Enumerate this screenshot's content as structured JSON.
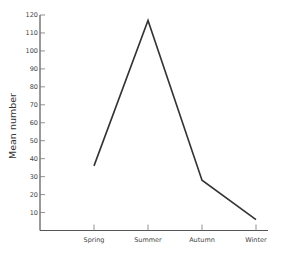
{
  "chart_data": {
    "type": "line",
    "title": "",
    "xlabel": "",
    "ylabel": "Mean number",
    "categories": [
      "Spring",
      "Summer",
      "Autumn",
      "Winter"
    ],
    "values": [
      36,
      117,
      28,
      6
    ],
    "ylim": [
      0,
      120
    ],
    "yticks": [
      10,
      20,
      30,
      40,
      50,
      60,
      70,
      80,
      90,
      100,
      110,
      120
    ],
    "grid": false,
    "legend": null,
    "line_color": "#333333"
  }
}
